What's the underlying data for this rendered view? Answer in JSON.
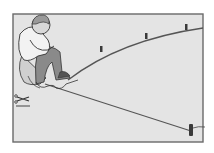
{
  "illustration": {
    "subject": "man kneeling laying out a curved line with stakes and string",
    "colors": {
      "page": "#ffffff",
      "panel": "#e4e4e4",
      "frame": "#6a6a6a",
      "line": "#555555",
      "stake": "#3a3a3a",
      "skin": "#d8d8d8",
      "shirt": "#f2f2f2",
      "pants": "#8a8a8a",
      "hair": "#9a9a9a",
      "ink": "#333333"
    },
    "frame": {
      "x": 13,
      "y": 14,
      "w": 190,
      "h": 128
    },
    "curve_stakes": [
      {
        "x": 101,
        "y": 50
      },
      {
        "x": 146,
        "y": 36
      },
      {
        "x": 186,
        "y": 27
      }
    ],
    "corner_stake": {
      "x": 191,
      "y": 131
    },
    "tools_on_ground": "scissors-and-string"
  }
}
